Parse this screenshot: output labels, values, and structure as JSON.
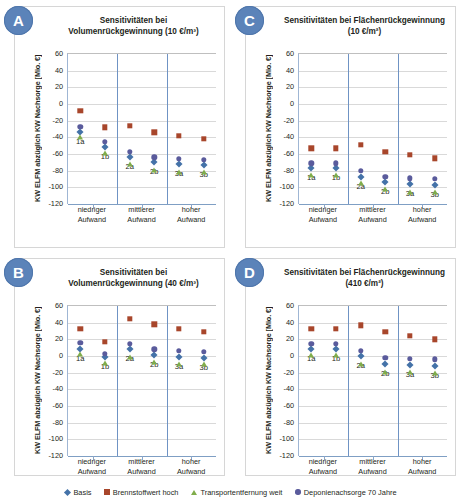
{
  "figure": {
    "yaxis_title": "KW ELFM abzüglich KW Nachsorge [Mio. €]",
    "ylim": [
      -120,
      60
    ],
    "yticks": [
      60,
      40,
      20,
      0,
      -20,
      -40,
      -60,
      -80,
      -100,
      -120
    ],
    "ytick_labels": [
      "60",
      "40",
      "20",
      "0",
      "-20",
      "-40",
      "-60",
      "-80",
      "-100",
      "-120"
    ],
    "categories": [
      "niedriger Aufwand",
      "mittlerer Aufwand",
      "hoher Aufwand"
    ],
    "category_lines": [
      "niedriger",
      "mittlerer",
      "hoher"
    ],
    "category_line2": "Aufwand",
    "point_labels": [
      "1a",
      "1b",
      "2a",
      "2b",
      "3a",
      "3b"
    ]
  },
  "legend": {
    "position": "bottom",
    "entries": [
      {
        "label": "Basis",
        "marker": "diamond",
        "color": "#4472a8"
      },
      {
        "label": "Brennstoffwert hoch",
        "marker": "square",
        "color": "#a8462b"
      },
      {
        "label": "Transportentfernung weit",
        "marker": "triangle",
        "color": "#80ad4b"
      },
      {
        "label": "Deponienachsorge 70 Jahre",
        "marker": "circle",
        "color": "#5a5b9c"
      }
    ]
  },
  "panels": [
    {
      "badge": "A",
      "title_line1": "Sensitivitäten bei",
      "title_line2": "Volumenrückgewinnung (10 €/m³)",
      "chart_data": {
        "type": "scatter",
        "title": "Sensitivitäten bei Volumenrückgewinnung (10 €/m³)",
        "xlabel": "",
        "ylabel": "KW ELFM abzüglich KW Nachsorge [Mio. €]",
        "ylim": [
          -120,
          60
        ],
        "grid": true,
        "x": [
          "1a",
          "1b",
          "2a",
          "2b",
          "3a",
          "3b"
        ],
        "series": [
          {
            "name": "Basis",
            "values": [
              -33,
              -51,
              -63,
              -70,
              -72,
              -73
            ]
          },
          {
            "name": "Brennstoffwert hoch",
            "values": [
              -8,
              -28,
              -26,
              -34,
              -38,
              -42
            ]
          },
          {
            "name": "Transportentfernung weit",
            "values": [
              -40,
              -59,
              -72,
              -79,
              -81,
              -82
            ]
          },
          {
            "name": "Deponienachsorge 70 Jahre",
            "values": [
              -27,
              -45,
              -57,
              -64,
              -66,
              -67
            ]
          }
        ]
      }
    },
    {
      "badge": "C",
      "title_line1": "Sensitivitäten bei Flächenrückgewinnung",
      "title_line2": "(10 €/m²)",
      "chart_data": {
        "type": "scatter",
        "title": "Sensitivitäten bei Flächenrückgewinnung (10 €/m²)",
        "xlabel": "",
        "ylabel": "KW ELFM abzüglich KW Nachsorge [Mio. €]",
        "ylim": [
          -120,
          60
        ],
        "grid": true,
        "x": [
          "1a",
          "1b",
          "2a",
          "2b",
          "3a",
          "3b"
        ],
        "series": [
          {
            "name": "Basis",
            "values": [
              -77,
              -77,
              -88,
              -93,
              -96,
              -97
            ]
          },
          {
            "name": "Brennstoffwert hoch",
            "values": [
              -53,
              -53,
              -49,
              -57,
              -61,
              -65
            ]
          },
          {
            "name": "Transportentfernung weit",
            "values": [
              -85,
              -85,
              -95,
              -102,
              -105,
              -106
            ]
          },
          {
            "name": "Deponienachsorge 70 Jahre",
            "values": [
              -71,
              -71,
              -80,
              -87,
              -89,
              -90
            ]
          }
        ]
      }
    },
    {
      "badge": "B",
      "title_line1": "Sensitivitäten bei",
      "title_line2": "Volumenrückgewinnung (40 €/m³)",
      "chart_data": {
        "type": "scatter",
        "title": "Sensitivitäten bei Volumenrückgewinnung (40 €/m³)",
        "xlabel": "",
        "ylabel": "KW ELFM abzüglich KW Nachsorge [Mio. €]",
        "ylim": [
          -120,
          60
        ],
        "grid": true,
        "x": [
          "1a",
          "1b",
          "2a",
          "2b",
          "3a",
          "3b"
        ],
        "series": [
          {
            "name": "Basis",
            "values": [
              9,
              -1,
              9,
              1,
              -1,
              -2
            ]
          },
          {
            "name": "Brennstoffwert hoch",
            "values": [
              33,
              17,
              45,
              38,
              33,
              29
            ]
          },
          {
            "name": "Transportentfernung weit",
            "values": [
              2,
              -8,
              -1,
              -7,
              -9,
              -10
            ]
          },
          {
            "name": "Deponienachsorge 70 Jahre",
            "values": [
              16,
              3,
              15,
              8,
              6,
              5
            ]
          }
        ]
      }
    },
    {
      "badge": "D",
      "title_line1": "Sensitivitäten bei Flächenrückgewinnung",
      "title_line2": "(410 €/m²)",
      "chart_data": {
        "type": "scatter",
        "title": "Sensitivitäten bei Flächenrückgewinnung (410 €/m²)",
        "xlabel": "",
        "ylabel": "KW ELFM abzüglich KW Nachsorge [Mio. €]",
        "ylim": [
          -120,
          60
        ],
        "grid": true,
        "x": [
          "1a",
          "1b",
          "2a",
          "2b",
          "3a",
          "3b"
        ],
        "series": [
          {
            "name": "Basis",
            "values": [
              8,
              8,
              0,
              -10,
              -11,
              -12
            ]
          },
          {
            "name": "Brennstoffwert hoch",
            "values": [
              33,
              33,
              37,
              29,
              24,
              20
            ]
          },
          {
            "name": "Transportentfernung weit",
            "values": [
              1,
              1,
              -9,
              -19,
              -19,
              -20
            ]
          },
          {
            "name": "Deponienachsorge 70 Jahre",
            "values": [
              15,
              15,
              6,
              -2,
              -3,
              -4
            ]
          }
        ]
      }
    }
  ]
}
